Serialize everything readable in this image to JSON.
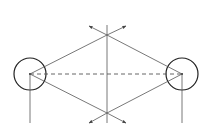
{
  "diagram": {
    "type": "geometric-construction",
    "colors": {
      "stroke": "#555555",
      "circle": "#222222",
      "background": "#ffffff"
    },
    "left_circle": {
      "cx": 30,
      "cy": 74,
      "r": 16
    },
    "right_circle": {
      "cx": 182,
      "cy": 74,
      "r": 16
    },
    "top_intersection": {
      "x": 107,
      "y": 35
    },
    "bottom_intersection": {
      "x": 107,
      "y": 113
    },
    "bisector": {
      "x": 107,
      "y1": 25,
      "y2": 123
    },
    "baseline_dashed": true
  }
}
